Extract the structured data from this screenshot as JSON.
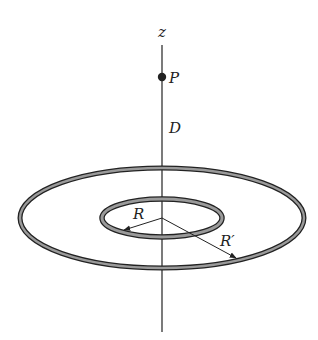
{
  "diagram": {
    "axis_label": "z",
    "point_label": "P",
    "distance_label": "D",
    "inner_radius_label": "R",
    "outer_radius_label": "R′",
    "colors": {
      "stroke": "#222222",
      "ring_fill": "#9a9a9a",
      "background": "#ffffff"
    }
  }
}
